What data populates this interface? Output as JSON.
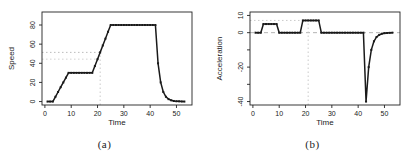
{
  "page": {
    "background": "#ffffff"
  },
  "figures": [
    {
      "caption": "(a)"
    },
    {
      "caption": "(b)"
    }
  ],
  "chart_data": [
    {
      "type": "line",
      "title": "",
      "xlabel": "Time",
      "ylabel": "Speed",
      "marker": "square",
      "line_color": "#1a1a1a",
      "axis_color": "#222222",
      "grid": false,
      "legend": null,
      "x": [
        1,
        2,
        3,
        4,
        5,
        6,
        7,
        8,
        9,
        10,
        11,
        12,
        13,
        14,
        15,
        16,
        17,
        18,
        19,
        20,
        21,
        22,
        23,
        24,
        25,
        26,
        27,
        28,
        29,
        30,
        31,
        32,
        33,
        34,
        35,
        36,
        37,
        38,
        39,
        40,
        41,
        42,
        43,
        44,
        45,
        46,
        47,
        48,
        49,
        50,
        51,
        52,
        53
      ],
      "values": [
        0,
        0,
        0,
        5,
        10,
        15,
        20,
        25,
        30,
        30,
        30,
        30,
        30,
        30,
        30,
        30,
        30,
        30,
        37.1,
        44.3,
        51.4,
        58.6,
        65.7,
        72.9,
        80,
        80,
        80,
        80,
        80,
        80,
        80,
        80,
        80,
        80,
        80,
        80,
        80,
        80,
        80,
        80,
        80,
        80,
        40,
        20,
        10,
        5,
        2.5,
        1.3,
        0.6,
        0.3,
        0.2,
        0.1,
        0
      ],
      "xlim": [
        -1.1,
        55.9
      ],
      "ylim": [
        -3.6,
        93.6
      ],
      "xticks": [
        0,
        10,
        20,
        30,
        40,
        50
      ],
      "yticks": [
        0,
        20,
        40,
        60,
        80
      ],
      "ytick_labels": [
        "0",
        "20",
        "40",
        "60",
        "80"
      ],
      "reflines": [
        {
          "type": "h",
          "y": 51.4,
          "x1": -1.1,
          "x2": 21,
          "dash": "1.5,2.5",
          "color": "#b4b4b4"
        },
        {
          "type": "h",
          "y": 44.3,
          "x1": -1.1,
          "x2": 20,
          "dash": "1.5,2.5",
          "color": "#cfcfcf"
        },
        {
          "type": "v",
          "x": 21,
          "y1": -3.6,
          "y2": 51.4,
          "dash": "1.5,2.5",
          "color": "#c4c4c4"
        }
      ]
    },
    {
      "type": "line",
      "title": "",
      "xlabel": "Time",
      "ylabel": "Acceleration",
      "marker": "square",
      "line_color": "#1a1a1a",
      "axis_color": "#222222",
      "grid": false,
      "legend": null,
      "x": [
        1,
        2,
        3,
        4,
        5,
        6,
        7,
        8,
        9,
        10,
        11,
        12,
        13,
        14,
        15,
        16,
        17,
        18,
        19,
        20,
        21,
        22,
        23,
        24,
        25,
        26,
        27,
        28,
        29,
        30,
        31,
        32,
        33,
        34,
        35,
        36,
        37,
        38,
        39,
        40,
        41,
        42,
        43,
        44,
        45,
        46,
        47,
        48,
        49,
        50,
        51,
        52,
        53
      ],
      "values": [
        0,
        0,
        0,
        5,
        5,
        5,
        5,
        5,
        5,
        0,
        0,
        0,
        0,
        0,
        0,
        0,
        0,
        0,
        7.1,
        7.1,
        7.1,
        7.1,
        7.1,
        7.1,
        7.1,
        0,
        0,
        0,
        0,
        0,
        0,
        0,
        0,
        0,
        0,
        0,
        0,
        0,
        0,
        0,
        0,
        0,
        -40,
        -20,
        -10,
        -5,
        -2.5,
        -1.3,
        -0.6,
        -0.3,
        -0.2,
        -0.1,
        0
      ],
      "xlim": [
        -1.1,
        55.9
      ],
      "ylim": [
        -42,
        12
      ],
      "xticks": [
        0,
        10,
        20,
        30,
        40,
        50
      ],
      "yticks": [
        10,
        0,
        -10,
        -20,
        -30,
        -40
      ],
      "ytick_labels": [
        "10",
        "0",
        "",
        "-20",
        "",
        "-40"
      ],
      "reflines": [
        {
          "type": "h",
          "y": 0,
          "x1": -1.1,
          "x2": 55.9,
          "dash": "4,3",
          "color": "#ababab"
        },
        {
          "type": "h",
          "y": 7.1,
          "x1": -1.1,
          "x2": 25,
          "dash": "1.5,2.5",
          "color": "#c4c4c4"
        },
        {
          "type": "v",
          "x": 21,
          "y1": -42,
          "y2": 7.1,
          "dash": "1.5,2.5",
          "color": "#c4c4c4"
        }
      ]
    }
  ]
}
